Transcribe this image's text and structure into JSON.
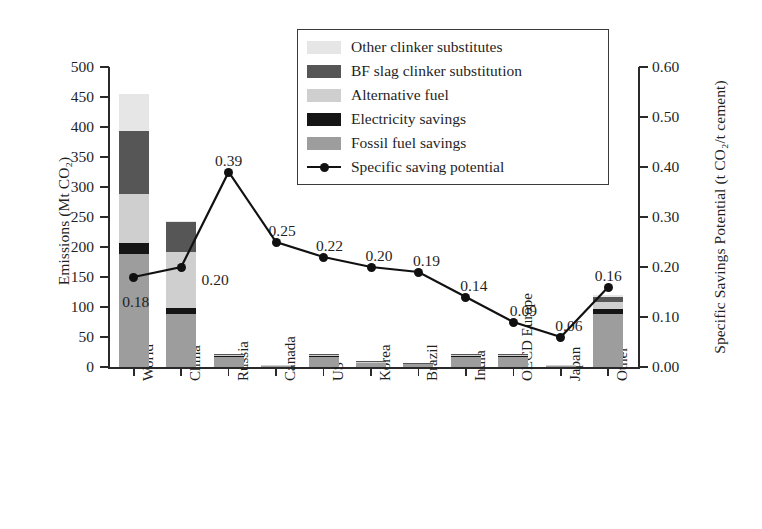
{
  "chart_data": {
    "type": "bar",
    "title": "",
    "subtitle": "",
    "xlabel": "",
    "ylabel": "Emissions (Mt CO₂)",
    "y2label": "Specific Savings Potential (t CO₂/t cement)",
    "ylim": [
      0,
      500
    ],
    "y2lim": [
      0.0,
      0.6
    ],
    "grid": false,
    "legend_position": "top-right",
    "categories": [
      "World",
      "China",
      "Russia",
      "Canada",
      "US",
      "Korea",
      "Brazil",
      "India",
      "OECD Europe",
      "Japan",
      "Other"
    ],
    "y_ticks": [
      "0",
      "50",
      "100",
      "150",
      "200",
      "250",
      "300",
      "350",
      "400",
      "450",
      "500"
    ],
    "y2_ticks": [
      "0.00",
      "0.10",
      "0.20",
      "0.30",
      "0.40",
      "0.50",
      "0.60"
    ],
    "stacking_order_bottom_to_top": [
      "Fossil fuel savings",
      "Electricity savings",
      "Alternative fuel",
      "BF slag clinker substitution",
      "Other clinker substitutes"
    ],
    "series": [
      {
        "name": "Fossil fuel savings",
        "color": "#9d9d9d",
        "values": [
          188,
          88,
          17,
          2,
          17,
          7,
          5,
          16,
          16,
          2,
          88
        ]
      },
      {
        "name": "Electricity savings",
        "color": "#151515",
        "values": [
          18,
          10,
          2,
          0.5,
          2,
          1,
          1,
          2,
          2,
          0.5,
          9
        ]
      },
      {
        "name": "Alternative fuel",
        "color": "#cfcfcf",
        "values": [
          83,
          93,
          2,
          0.5,
          2,
          1,
          1,
          2,
          2,
          0.5,
          11
        ]
      },
      {
        "name": "BF slag clinker substitution",
        "color": "#565656",
        "values": [
          105,
          50,
          1,
          0,
          1,
          1,
          0.5,
          1,
          1,
          0,
          8
        ]
      },
      {
        "name": "Other clinker substitutes",
        "color": "#e6e6e6",
        "values": [
          61,
          2,
          0,
          0,
          0,
          0,
          0,
          0,
          0,
          0,
          4
        ]
      }
    ],
    "bar_totals": [
      455,
      243,
      22,
      3,
      22,
      10,
      7.5,
      21,
      21,
      3,
      120
    ],
    "line_series": {
      "name": "Specific saving potential",
      "color": "#111111",
      "marker": "circle",
      "axis": "right",
      "values": [
        0.18,
        0.2,
        0.39,
        0.25,
        0.22,
        0.2,
        0.19,
        0.14,
        0.09,
        0.06,
        0.16
      ],
      "point_labels": [
        "0.18",
        "0.20",
        "0.39",
        "0.25",
        "0.22",
        "0.20",
        "0.19",
        "0.14",
        "0.09",
        "0.06",
        "0.16"
      ]
    }
  },
  "legend": {
    "items": [
      {
        "label": "Other clinker substitutes",
        "color": "#e6e6e6",
        "type": "swatch"
      },
      {
        "label": "BF slag clinker substitution",
        "color": "#565656",
        "type": "swatch"
      },
      {
        "label": "Alternative fuel",
        "color": "#cfcfcf",
        "type": "swatch"
      },
      {
        "label": "Electricity savings",
        "color": "#151515",
        "type": "swatch"
      },
      {
        "label": "Fossil fuel savings",
        "color": "#9d9d9d",
        "type": "swatch"
      },
      {
        "label": "Specific saving potential",
        "color": "#111111",
        "type": "line-marker"
      }
    ]
  }
}
